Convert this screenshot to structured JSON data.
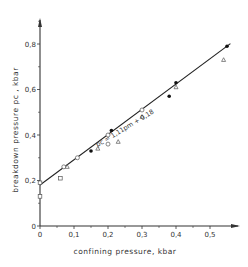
{
  "chart_data": {
    "type": "scatter",
    "title": "",
    "xlabel": "confining pressure, kbar",
    "ylabel": "breakdown pressure  p_c , kbar",
    "xlim": [
      0,
      0.58
    ],
    "ylim": [
      0,
      0.95
    ],
    "x_ticks": [
      "0",
      "0,1",
      "0,2",
      "0,3",
      "0,4",
      "0,5"
    ],
    "y_ticks": [
      "0",
      "0,2",
      "0,4",
      "0,6",
      "0,8"
    ],
    "grid": false,
    "fit_line": {
      "label": "p_c = 1.11 p_m + 0.18",
      "display": "pc = 1,11pm + 0,18",
      "slope": 1.11,
      "intercept": 0.18,
      "x_range": [
        0,
        0.56
      ]
    },
    "series": [
      {
        "name": "filled circles",
        "marker": "filled-circle",
        "points": [
          [
            0.15,
            0.33
          ],
          [
            0.21,
            0.42
          ],
          [
            0.38,
            0.57
          ],
          [
            0.4,
            0.63
          ],
          [
            0.55,
            0.79
          ]
        ]
      },
      {
        "name": "open circles",
        "marker": "open-circle",
        "points": [
          [
            0.07,
            0.26
          ],
          [
            0.11,
            0.3
          ],
          [
            0.2,
            0.36
          ],
          [
            0.2,
            0.4
          ],
          [
            0.3,
            0.51
          ]
        ]
      },
      {
        "name": "open triangles",
        "marker": "open-triangle",
        "points": [
          [
            0.08,
            0.26
          ],
          [
            0.17,
            0.34
          ],
          [
            0.23,
            0.37
          ],
          [
            0.3,
            0.48
          ],
          [
            0.4,
            0.61
          ],
          [
            0.54,
            0.73
          ]
        ]
      },
      {
        "name": "open squares",
        "marker": "open-square",
        "points": [
          [
            0.0,
            0.13
          ],
          [
            0.0,
            0.19
          ],
          [
            0.06,
            0.21
          ]
        ]
      }
    ]
  },
  "labels": {
    "xlabel": "confining pressure,  kbar",
    "ylabel": "breakdown  pressure  pc ,  kbar",
    "equation": "pc = 1,11pm + 0,18"
  }
}
